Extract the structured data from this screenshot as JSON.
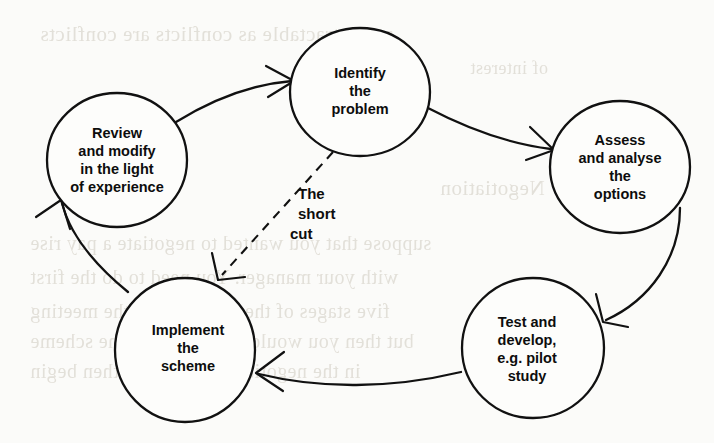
{
  "diagram": {
    "type": "cycle-flow-diagram",
    "background_color": "#fbfbf9",
    "ink_color": "#111111",
    "nodes": [
      {
        "id": "identify",
        "shape": "circle",
        "cx": 360,
        "cy": 92,
        "rx": 70,
        "ry": 64,
        "lines": [
          "Identify",
          "the",
          "problem"
        ]
      },
      {
        "id": "assess",
        "shape": "circle",
        "cx": 620,
        "cy": 167,
        "rx": 70,
        "ry": 66,
        "lines": [
          "Assess",
          "and analyse",
          "the",
          "options"
        ]
      },
      {
        "id": "test",
        "shape": "circle",
        "cx": 533,
        "cy": 348,
        "rx": 71,
        "ry": 70,
        "lines": [
          "Test and",
          "develop,",
          "e.g. pilot",
          "study"
        ]
      },
      {
        "id": "implement",
        "shape": "circle",
        "cx": 185,
        "cy": 350,
        "rx": 70,
        "ry": 72,
        "lines": [
          "Implement",
          "the",
          "scheme"
        ]
      },
      {
        "id": "review",
        "shape": "circle",
        "cx": 117,
        "cy": 160,
        "rx": 70,
        "ry": 67,
        "lines": [
          "Review",
          "and modify",
          "in the light",
          "of experience"
        ]
      }
    ],
    "annotations": [
      {
        "id": "short-cut",
        "lines": [
          "The",
          "short",
          "cut"
        ],
        "x": 298,
        "y": 199,
        "line_height": 20
      }
    ],
    "edges": [
      {
        "id": "review-to-identify",
        "from": "review",
        "to": "identify",
        "style": "solid"
      },
      {
        "id": "identify-to-assess",
        "from": "identify",
        "to": "assess",
        "style": "solid"
      },
      {
        "id": "assess-to-test",
        "from": "assess",
        "to": "test",
        "style": "solid"
      },
      {
        "id": "test-to-implement",
        "from": "test",
        "to": "implement",
        "style": "solid"
      },
      {
        "id": "implement-to-review",
        "from": "implement",
        "to": "review",
        "style": "solid"
      },
      {
        "id": "identify-to-implement-shortcut",
        "from": "identify",
        "to": "implement",
        "style": "dashed",
        "label": "The short cut"
      }
    ]
  },
  "ghost_text": {
    "note": "faint show-through from reverse of page",
    "lines": [
      {
        "text": "and intractable as conflicts are conflicts",
        "x": 40,
        "y": 22,
        "size": 21
      },
      {
        "text": "of interest",
        "x": 470,
        "y": 58,
        "size": 18
      },
      {
        "text": "Negotiation",
        "x": 440,
        "y": 176,
        "size": 21
      },
      {
        "text": "suppose that you wanted to negotiate a pay rise",
        "x": 30,
        "y": 232,
        "size": 20
      },
      {
        "text": "with your manager. You need to do the first",
        "x": 30,
        "y": 266,
        "size": 20
      },
      {
        "text": "five stages of the cycle before the meeting",
        "x": 30,
        "y": 300,
        "size": 20
      },
      {
        "text": "but then you would need to begin the scheme",
        "x": 30,
        "y": 330,
        "size": 20
      },
      {
        "text": "in the negotiating sense and then begin",
        "x": 30,
        "y": 360,
        "size": 20
      }
    ]
  }
}
